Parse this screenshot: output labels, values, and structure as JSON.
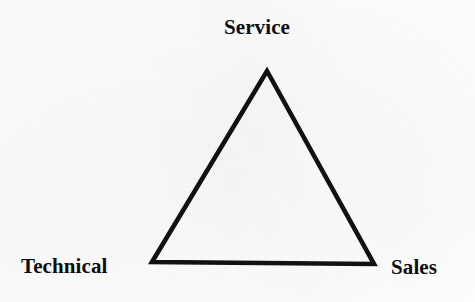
{
  "diagram": {
    "type": "triangle-relationship-diagram",
    "shape_name": "triangle",
    "background_color": "#ffffff",
    "stroke_color": "#111111",
    "stroke_width_px": 4.5,
    "vertices": [
      {
        "id": "apex",
        "label": "Service",
        "x": 267,
        "y": 71
      },
      {
        "id": "bottom-left",
        "label": "Technical",
        "x": 152,
        "y": 262
      },
      {
        "id": "bottom-right",
        "label": "Sales",
        "x": 374,
        "y": 264
      }
    ],
    "labels": {
      "top": "Service",
      "bottom_left": "Technical",
      "bottom_right": "Sales"
    }
  }
}
